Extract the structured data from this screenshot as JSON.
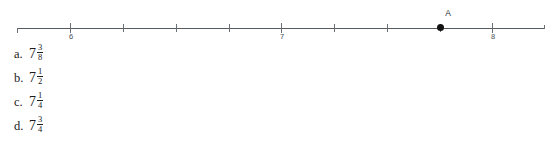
{
  "numberline": {
    "point": {
      "label": "A",
      "value": "7 3/4",
      "value_decimal": 7.75
    },
    "axis": {
      "min": 5.75,
      "max": 8.25,
      "tick_interval": 0.25,
      "labeled_interval": 1
    },
    "labeled_ticks": [
      {
        "label": "6",
        "value": 6
      },
      {
        "label": "7",
        "value": 7
      },
      {
        "label": "8",
        "value": 8
      }
    ],
    "minor_tick_values": [
      6.25,
      6.5,
      6.75,
      7.25,
      7.5,
      7.75
    ],
    "colors": {
      "line": "#555a5e",
      "tick": "#6a6f73",
      "label": "#4a4f53",
      "point": "#121212"
    }
  },
  "choices": [
    {
      "letter": "a.",
      "whole": "7",
      "numerator": "3",
      "denominator": "8"
    },
    {
      "letter": "b.",
      "whole": "7",
      "numerator": "1",
      "denominator": "2"
    },
    {
      "letter": "c.",
      "whole": "7",
      "numerator": "1",
      "denominator": "4"
    },
    {
      "letter": "d.",
      "whole": "7",
      "numerator": "3",
      "denominator": "4"
    }
  ]
}
